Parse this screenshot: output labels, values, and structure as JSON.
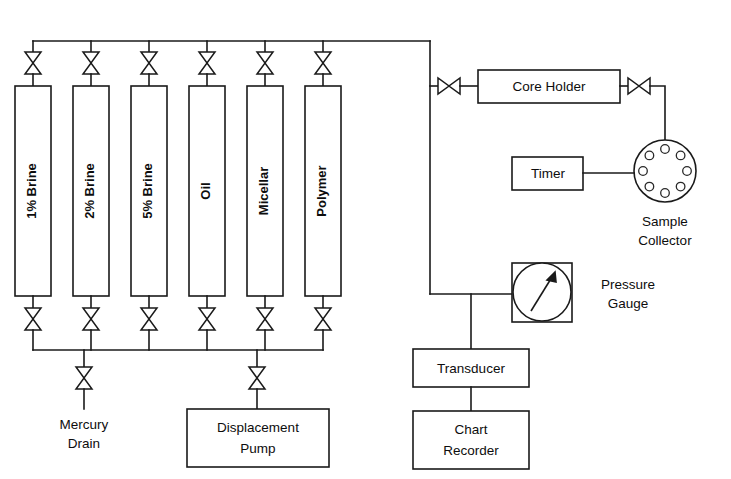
{
  "diagram": {
    "colors": {
      "stroke": "#1a1a1a",
      "fill": "#ffffff",
      "text": "#0d0d0d",
      "background": "#ffffff"
    },
    "vessels": [
      {
        "id": "vessel-1-brine",
        "label": "1% Brine"
      },
      {
        "id": "vessel-2-brine",
        "label": "2% Brine"
      },
      {
        "id": "vessel-5-brine",
        "label": "5% Brine"
      },
      {
        "id": "vessel-oil",
        "label": "Oil"
      },
      {
        "id": "vessel-micellar",
        "label": "Micellar"
      },
      {
        "id": "vessel-polymer",
        "label": "Polymer"
      }
    ],
    "boxes": {
      "core_holder": {
        "label": "Core Holder"
      },
      "timer": {
        "label": "Timer"
      },
      "transducer": {
        "label": "Transducer"
      },
      "chart_recorder": {
        "line1": "Chart",
        "line2": "Recorder"
      },
      "displacement_pump": {
        "line1": "Displacement",
        "line2": "Pump"
      }
    },
    "free_labels": {
      "sample_collector": {
        "line1": "Sample",
        "line2": "Collector"
      },
      "pressure_gauge": {
        "line1": "Pressure",
        "line2": "Gauge"
      },
      "mercury_drain": {
        "line1": "Mercury",
        "line2": "Drain"
      }
    },
    "valves": {
      "top_row_count": 6,
      "bottom_row_count": 6,
      "mercury_drain_valve": "valve-mercury-drain",
      "pump_valve": "valve-displacement-pump",
      "core_inlet_valve": "valve-core-inlet",
      "core_outlet_valve": "valve-core-outlet",
      "symbol": "bowtie-needle-valve"
    },
    "sample_collector": {
      "port_count": 8
    },
    "pressure_gauge": {
      "needle_direction": "up-right"
    }
  }
}
